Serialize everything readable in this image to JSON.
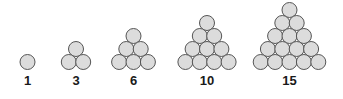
{
  "figure": {
    "type": "triangular-numbers-diagram",
    "width": 343,
    "height": 99,
    "background_color": "#ffffff",
    "circle": {
      "fill_color": "#dcdcdc",
      "stroke_color": "#555555",
      "stroke_width": 1,
      "diameter": 15,
      "radius": 7.5,
      "horizontal_spacing": 14.4,
      "vertical_spacing": 13.0
    },
    "label": {
      "color": "#1a1a1a",
      "font_size": 13,
      "font_weight": "bold",
      "baseline_y": 85
    },
    "baseline_row_center_y": 62,
    "groups": [
      {
        "index": 1,
        "label": "1",
        "name": "group-1",
        "rows": 1,
        "dot_count": 1,
        "center_x": 27.5,
        "label_x": 27.5
      },
      {
        "index": 2,
        "label": "3",
        "name": "group-3",
        "rows": 2,
        "dot_count": 3,
        "center_x": 76.0,
        "label_x": 76.0
      },
      {
        "index": 3,
        "label": "6",
        "name": "group-6",
        "rows": 3,
        "dot_count": 6,
        "center_x": 133.5,
        "label_x": 133.5
      },
      {
        "index": 4,
        "label": "10",
        "name": "group-10",
        "rows": 4,
        "dot_count": 10,
        "center_x": 207.0,
        "label_x": 207.0
      },
      {
        "index": 5,
        "label": "15",
        "name": "group-15",
        "rows": 5,
        "dot_count": 15,
        "center_x": 289.5,
        "label_x": 289.5
      }
    ]
  },
  "chart_data": {
    "type": "bar",
    "xlabel": "",
    "ylabel": "",
    "categories": [
      "1",
      "3",
      "6",
      "10",
      "15"
    ],
    "values": [
      1,
      3,
      6,
      10,
      15
    ],
    "series": [
      {
        "name": "Triangular number",
        "values": [
          1,
          3,
          6,
          10,
          15
        ]
      },
      {
        "name": "Rows in triangle",
        "values": [
          1,
          2,
          3,
          4,
          5
        ]
      }
    ],
    "annotations": [
      "1",
      "3",
      "6",
      "10",
      "15"
    ],
    "legend": "none",
    "grid": false
  }
}
